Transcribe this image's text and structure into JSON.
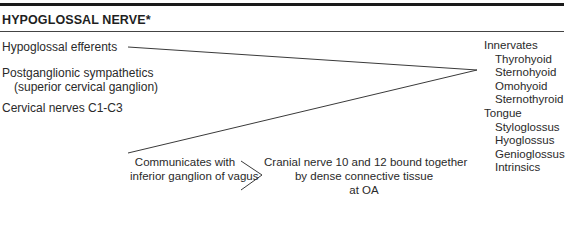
{
  "title": "HYPOGLOSSAL NERVE*",
  "sources": {
    "hypoglossal_efferents": "Hypoglossal efferents",
    "sympathetics_line1": "Postganglionic sympathetics",
    "sympathetics_line2": "(superior cervical ganglion)",
    "cervical": "Cervical nerves C1-C3"
  },
  "innervates": {
    "header": "Innervates",
    "muscles": [
      "Thyrohyoid",
      "Sternohyoid",
      "Omohyoid",
      "Sternothyroid"
    ],
    "tongue_header": "Tongue",
    "tongue_muscles": [
      "Styloglossus",
      "Hyoglossus",
      "Genioglossus",
      "Intrinsics"
    ]
  },
  "communicates": {
    "line1": "Communicates with",
    "line2": "inferior ganglion of vagus"
  },
  "bound": {
    "line1": "Cranial nerve 10 and 12 bound together",
    "line2": "by dense connective tissue",
    "line3": "at OA"
  },
  "colors": {
    "line": "#3a3a3a",
    "text": "#2a2a2a",
    "rule": "#1a1a1a"
  }
}
